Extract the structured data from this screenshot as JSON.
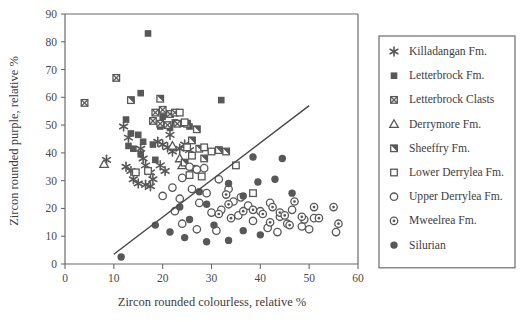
{
  "chart_data": {
    "type": "scatter",
    "title": "",
    "xlabel": "Zircon rounded colourless, relative %",
    "ylabel": "Zircon rounded purple, relative %",
    "xlim": [
      0,
      60
    ],
    "ylim": [
      0,
      90
    ],
    "xticks": [
      0,
      10,
      20,
      30,
      40,
      50,
      60
    ],
    "yticks": [
      0,
      10,
      20,
      30,
      40,
      50,
      60,
      70,
      80,
      90
    ],
    "grid": false,
    "legend_position": "right",
    "annotations": [
      {
        "name": "discriminant-line",
        "type": "line",
        "x": [
          10.0,
          50.0
        ],
        "y": [
          3.5,
          57.0
        ]
      }
    ],
    "series": [
      {
        "name": "Killadangan Fm.",
        "marker": "asterisk",
        "color": "#585858",
        "points": [
          [
            8.5,
            37.5
          ],
          [
            12.0,
            49.5
          ],
          [
            13.0,
            45.5
          ],
          [
            15.5,
            41.5
          ],
          [
            16.0,
            38.0
          ],
          [
            16.5,
            35.5
          ],
          [
            17.5,
            33.0
          ],
          [
            18.0,
            30.5
          ],
          [
            19.0,
            44.0
          ],
          [
            20.0,
            43.0
          ],
          [
            21.0,
            42.0
          ],
          [
            21.5,
            46.5
          ],
          [
            22.0,
            40.5
          ],
          [
            23.5,
            41.5
          ],
          [
            24.5,
            43.0
          ],
          [
            25.5,
            41.0
          ],
          [
            14.0,
            30.5
          ],
          [
            15.0,
            29.0
          ],
          [
            16.5,
            28.5
          ],
          [
            17.5,
            28.0
          ],
          [
            12.5,
            35.0
          ],
          [
            13.5,
            33.5
          ],
          [
            19.5,
            35.5
          ],
          [
            20.5,
            33.5
          ]
        ]
      },
      {
        "name": "Letterbrock Fm.",
        "marker": "filled-square",
        "color": "#585858",
        "points": [
          [
            17.0,
            83.0
          ],
          [
            15.5,
            61.5
          ],
          [
            32.0,
            59.0
          ],
          [
            12.5,
            52.0
          ],
          [
            13.5,
            47.0
          ],
          [
            15.0,
            46.5
          ],
          [
            16.0,
            44.0
          ],
          [
            15.5,
            39.5
          ],
          [
            14.0,
            41.5
          ],
          [
            18.0,
            43.0
          ],
          [
            19.5,
            49.5
          ],
          [
            21.5,
            49.0
          ],
          [
            22.5,
            51.0
          ],
          [
            23.5,
            50.5
          ],
          [
            24.5,
            50.5
          ],
          [
            25.5,
            49.5
          ],
          [
            20.0,
            53.0
          ],
          [
            26.5,
            34.5
          ],
          [
            13.0,
            42.5
          ],
          [
            18.5,
            37.5
          ]
        ]
      },
      {
        "name": "Letterbrock Clasts",
        "marker": "crossed-square",
        "color": "#585858",
        "points": [
          [
            4.0,
            58.0
          ],
          [
            10.5,
            67.0
          ],
          [
            18.5,
            54.5
          ],
          [
            20.0,
            55.5
          ],
          [
            21.5,
            54.0
          ],
          [
            22.5,
            54.5
          ],
          [
            19.5,
            50.5
          ],
          [
            21.0,
            50.0
          ],
          [
            23.0,
            50.5
          ],
          [
            18.0,
            51.5
          ]
        ]
      },
      {
        "name": "Derrymore Fm.",
        "marker": "open-triangle",
        "color": "#585858",
        "points": [
          [
            8.0,
            36.0
          ],
          [
            22.0,
            42.5
          ],
          [
            23.5,
            38.0
          ],
          [
            24.0,
            35.5
          ]
        ]
      },
      {
        "name": "Sheeffry Fm.",
        "marker": "half-square",
        "color": "#585858",
        "points": [
          [
            13.5,
            59.0
          ],
          [
            19.5,
            59.5
          ],
          [
            25.0,
            50.5
          ],
          [
            27.0,
            48.5
          ],
          [
            27.5,
            41.5
          ],
          [
            28.5,
            38.0
          ],
          [
            26.0,
            44.5
          ],
          [
            24.5,
            36.5
          ],
          [
            33.0,
            40.5
          ],
          [
            31.5,
            41.0
          ]
        ]
      },
      {
        "name": "Lower Derrylea Fm.",
        "marker": "open-square",
        "color": "#585858",
        "points": [
          [
            23.5,
            54.5
          ],
          [
            24.5,
            51.0
          ],
          [
            17.0,
            33.5
          ],
          [
            25.0,
            42.0
          ],
          [
            26.0,
            39.0
          ],
          [
            28.5,
            42.0
          ],
          [
            30.0,
            40.5
          ],
          [
            35.0,
            35.5
          ],
          [
            28.0,
            31.5
          ],
          [
            38.5,
            25.5
          ],
          [
            25.5,
            32.0
          ],
          [
            14.5,
            33.0
          ]
        ]
      },
      {
        "name": "Upper Derrylea Fm.",
        "marker": "open-circle",
        "color": "#585858",
        "points": [
          [
            25.5,
            35.0
          ],
          [
            27.0,
            34.0
          ],
          [
            28.5,
            34.5
          ],
          [
            24.0,
            31.0
          ],
          [
            22.0,
            27.5
          ],
          [
            20.0,
            24.5
          ],
          [
            26.0,
            27.0
          ],
          [
            29.0,
            25.5
          ],
          [
            31.5,
            30.5
          ],
          [
            33.5,
            27.0
          ],
          [
            34.5,
            22.5
          ],
          [
            36.0,
            24.0
          ],
          [
            27.5,
            22.0
          ],
          [
            30.0,
            18.5
          ],
          [
            32.0,
            19.5
          ],
          [
            35.5,
            17.5
          ],
          [
            37.5,
            21.0
          ],
          [
            38.5,
            15.5
          ],
          [
            40.0,
            19.0
          ],
          [
            42.0,
            22.0
          ],
          [
            44.0,
            17.0
          ],
          [
            45.5,
            14.5
          ],
          [
            46.5,
            19.5
          ],
          [
            48.5,
            13.5
          ],
          [
            50.0,
            12.5
          ],
          [
            51.0,
            16.5
          ],
          [
            24.0,
            14.5
          ],
          [
            27.0,
            12.5
          ],
          [
            31.0,
            12.0
          ],
          [
            41.5,
            13.0
          ],
          [
            43.5,
            11.5
          ],
          [
            49.0,
            16.0
          ],
          [
            55.5,
            11.5
          ],
          [
            22.5,
            19.0
          ],
          [
            23.5,
            23.5
          ]
        ]
      },
      {
        "name": "Mweelrea Fm.",
        "marker": "dot-circle",
        "color": "#585858",
        "points": [
          [
            33.0,
            25.0
          ],
          [
            33.5,
            21.5
          ],
          [
            36.5,
            19.0
          ],
          [
            31.5,
            18.0
          ],
          [
            38.5,
            19.5
          ],
          [
            40.5,
            18.0
          ],
          [
            42.5,
            20.5
          ],
          [
            44.0,
            18.5
          ],
          [
            45.0,
            17.5
          ],
          [
            47.0,
            22.5
          ],
          [
            48.5,
            17.0
          ],
          [
            51.0,
            20.5
          ],
          [
            52.0,
            16.5
          ],
          [
            55.0,
            20.5
          ],
          [
            56.0,
            14.5
          ],
          [
            46.0,
            14.0
          ],
          [
            34.0,
            16.5
          ],
          [
            42.0,
            15.0
          ]
        ]
      },
      {
        "name": "Silurian",
        "marker": "filled-circle",
        "color": "#585858",
        "points": [
          [
            11.5,
            2.5
          ],
          [
            18.5,
            14.0
          ],
          [
            25.5,
            16.0
          ],
          [
            27.5,
            26.0
          ],
          [
            29.0,
            21.5
          ],
          [
            33.5,
            29.0
          ],
          [
            36.5,
            24.5
          ],
          [
            39.5,
            29.5
          ],
          [
            43.0,
            30.5
          ],
          [
            46.5,
            25.5
          ],
          [
            38.5,
            38.5
          ],
          [
            44.5,
            38.0
          ],
          [
            21.5,
            11.5
          ],
          [
            24.5,
            9.5
          ],
          [
            29.0,
            8.0
          ],
          [
            33.5,
            8.5
          ],
          [
            36.5,
            12.0
          ],
          [
            40.0,
            10.5
          ],
          [
            30.5,
            14.0
          ],
          [
            23.5,
            20.5
          ]
        ]
      }
    ]
  },
  "legend": {
    "items": [
      {
        "label": "Killadangan Fm.",
        "marker": "asterisk"
      },
      {
        "label": "Letterbrock Fm.",
        "marker": "filled-square"
      },
      {
        "label": "Letterbrock Clasts",
        "marker": "crossed-square"
      },
      {
        "label": "Derrymore Fm.",
        "marker": "open-triangle"
      },
      {
        "label": "Sheeffry Fm.",
        "marker": "half-square"
      },
      {
        "label": "Lower Derrylea Fm.",
        "marker": "open-square"
      },
      {
        "label": "Upper Derrylea Fm.",
        "marker": "open-circle"
      },
      {
        "label": "Mweelrea Fm.",
        "marker": "dot-circle"
      },
      {
        "label": "Silurian",
        "marker": "filled-circle"
      }
    ]
  },
  "colors": {
    "marker": "#585858",
    "axis": "#6b6b6b",
    "text": "#3d3d3d",
    "background": "#ffffff"
  }
}
